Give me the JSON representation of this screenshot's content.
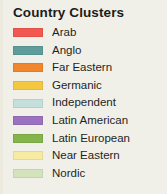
{
  "legend": {
    "title": "Country Clusters",
    "background_color": "#f1f0e8",
    "text_color": "#1f1f1f"
  },
  "chart_data": {
    "type": "legend",
    "title": "Country Clusters",
    "legend_position": "standalone",
    "categories": [
      "Arab",
      "Anglo",
      "Far Eastern",
      "Germanic",
      "Independent",
      "Latin American",
      "Latin European",
      "Near Eastern",
      "Nordic"
    ],
    "colors": [
      "#f2584f",
      "#5f9c9c",
      "#f0872f",
      "#f4c741",
      "#c3e0dd",
      "#9a72c0",
      "#85b34c",
      "#f7eaa2",
      "#d3e4bd"
    ],
    "entries": [
      {
        "label": "Arab",
        "color": "#f2584f"
      },
      {
        "label": "Anglo",
        "color": "#5f9c9c"
      },
      {
        "label": "Far Eastern",
        "color": "#f0872f"
      },
      {
        "label": "Germanic",
        "color": "#f4c741"
      },
      {
        "label": "Independent",
        "color": "#c3e0dd"
      },
      {
        "label": "Latin American",
        "color": "#9a72c0"
      },
      {
        "label": "Latin European",
        "color": "#85b34c"
      },
      {
        "label": "Near Eastern",
        "color": "#f7eaa2"
      },
      {
        "label": "Nordic",
        "color": "#d3e4bd"
      }
    ]
  }
}
